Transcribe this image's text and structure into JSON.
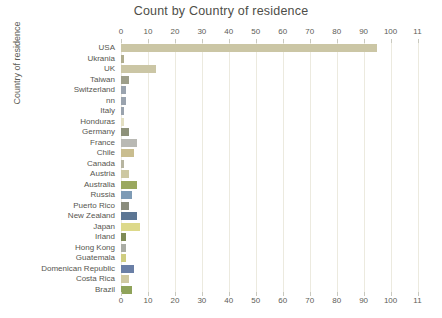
{
  "chart_data": {
    "type": "bar",
    "orientation": "horizontal",
    "title": "Count by Country of residence",
    "xlabel": "",
    "ylabel": "Country of residence",
    "xlim": [
      0,
      115
    ],
    "grid": true,
    "legend": "none",
    "xticks": [
      0,
      10,
      20,
      30,
      40,
      50,
      60,
      70,
      80,
      90,
      100,
      110
    ],
    "xtick_labels": [
      "0",
      "10",
      "20",
      "30",
      "40",
      "50",
      "60",
      "70",
      "80",
      "90",
      "100",
      "11"
    ],
    "axis_positions": [
      "top",
      "bottom"
    ],
    "categories": [
      "USA",
      "Ukrania",
      "UK",
      "Taiwan",
      "Switzerland",
      "nn",
      "Italy",
      "Honduras",
      "Germany",
      "France",
      "Chile",
      "Canada",
      "Austria",
      "Australia",
      "Russia",
      "Puerto Rico",
      "New Zealand",
      "Japan",
      "Irland",
      "Hong Kong",
      "Guatemala",
      "Domenican Republic",
      "Costa Rica",
      "Brazil"
    ],
    "values": [
      95,
      1,
      13,
      3,
      2,
      2,
      1,
      1,
      3,
      6,
      5,
      1,
      3,
      6,
      4,
      3,
      6,
      7,
      2,
      2,
      2,
      5,
      3,
      4
    ],
    "bar_colors": [
      "#cbc6a5",
      "#b0ad8e",
      "#cbc6a5",
      "#9e9f8a",
      "#9aa3ae",
      "#9aa3ae",
      "#9aa3ae",
      "#e3dfc2",
      "#8d9179",
      "#b9b9b4",
      "#c9bd8f",
      "#b7b5a0",
      "#cdc8a2",
      "#9aa85e",
      "#7e9bb5",
      "#8b8d7c",
      "#5c7694",
      "#ddd98a",
      "#7e8a55",
      "#a9aca4",
      "#cfcd80",
      "#6a7fa6",
      "#cfc9a1",
      "#8fa35a"
    ]
  }
}
